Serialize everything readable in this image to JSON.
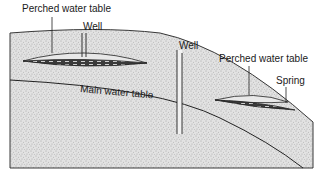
{
  "diagram": {
    "type": "geological cross-section",
    "labels": {
      "perched_upper": "Perched water table",
      "well_upper": "Well",
      "well_center": "Well",
      "perched_right": "Perched water table",
      "spring": "Spring",
      "main_table": "Main water table"
    },
    "colors": {
      "ground_fill": "#d9d9d9",
      "stipple": "#7a7a7a",
      "outline": "#222222",
      "water_lens_dark": "#3a3a3a",
      "water_lens_light": "#bdbdbd",
      "background": "#ffffff"
    }
  }
}
